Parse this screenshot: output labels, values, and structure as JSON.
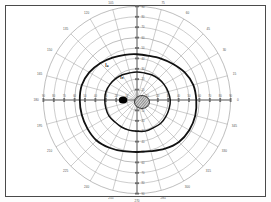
{
  "chart_data": {
    "type": "scatter",
    "projection": "polar",
    "xlabel": "",
    "ylabel": "",
    "grid": true,
    "legend_position": "inline-annotations",
    "center": {
      "x": 137,
      "y": 100,
      "label": "fixation"
    },
    "radial_axis": {
      "label": "eccentricity (degrees)",
      "ticks": [
        10,
        20,
        30,
        40,
        50,
        60,
        70,
        80,
        90
      ],
      "range": [
        0,
        90
      ],
      "ring_spacing_deg": 10,
      "px_per_10deg": 10.4
    },
    "angular_axis": {
      "label": "meridian (degrees)",
      "ticks": [
        0,
        15,
        30,
        45,
        60,
        75,
        90,
        105,
        120,
        135,
        150,
        165,
        180,
        195,
        210,
        225,
        240,
        255,
        270,
        285,
        300,
        315,
        330,
        345
      ],
      "spacing_deg": 15
    },
    "meridian_labels": [
      {
        "angle": 0,
        "text": "0"
      },
      {
        "angle": 15,
        "text": "15"
      },
      {
        "angle": 30,
        "text": "30"
      },
      {
        "angle": 45,
        "text": "45"
      },
      {
        "angle": 60,
        "text": "60"
      },
      {
        "angle": 75,
        "text": "75"
      },
      {
        "angle": 90,
        "text": "90"
      },
      {
        "angle": 105,
        "text": "105"
      },
      {
        "angle": 120,
        "text": "120"
      },
      {
        "angle": 135,
        "text": "135"
      },
      {
        "angle": 150,
        "text": "150"
      },
      {
        "angle": 165,
        "text": "165"
      },
      {
        "angle": 180,
        "text": "180"
      },
      {
        "angle": 195,
        "text": "195"
      },
      {
        "angle": 210,
        "text": "210"
      },
      {
        "angle": 225,
        "text": "225"
      },
      {
        "angle": 240,
        "text": "240"
      },
      {
        "angle": 255,
        "text": "255"
      },
      {
        "angle": 270,
        "text": "270"
      },
      {
        "angle": 285,
        "text": "285"
      },
      {
        "angle": 300,
        "text": "300"
      },
      {
        "angle": 315,
        "text": "315"
      },
      {
        "angle": 330,
        "text": "330"
      },
      {
        "angle": 345,
        "text": "345"
      }
    ],
    "horizontal_tick_labels_left": [
      "90",
      "80",
      "70",
      "60",
      "50",
      "40",
      "30",
      "20",
      "10"
    ],
    "horizontal_tick_labels_right": [
      "10",
      "20",
      "30",
      "40",
      "50",
      "60",
      "70",
      "80",
      "90"
    ],
    "vertical_tick_labels_up": [
      "10",
      "20",
      "30",
      "40",
      "50",
      "60",
      "70",
      "80",
      "90"
    ],
    "vertical_tick_labels_down": [
      "10",
      "20",
      "30",
      "40",
      "50",
      "60",
      "70",
      "80",
      "90"
    ],
    "series": [
      {
        "name": "I4",
        "label": "I₄",
        "type": "isopter",
        "stroke": "#111111",
        "stroke_width": 1.8,
        "label_position": {
          "angle": 131,
          "radius_deg": 44
        },
        "points_deg": [
          {
            "angle": 0,
            "r": 57
          },
          {
            "angle": 15,
            "r": 56
          },
          {
            "angle": 30,
            "r": 53
          },
          {
            "angle": 45,
            "r": 49
          },
          {
            "angle": 60,
            "r": 46
          },
          {
            "angle": 75,
            "r": 44
          },
          {
            "angle": 90,
            "r": 44
          },
          {
            "angle": 105,
            "r": 45
          },
          {
            "angle": 120,
            "r": 47
          },
          {
            "angle": 135,
            "r": 50
          },
          {
            "angle": 150,
            "r": 53
          },
          {
            "angle": 165,
            "r": 55
          },
          {
            "angle": 180,
            "r": 55
          },
          {
            "angle": 195,
            "r": 55
          },
          {
            "angle": 210,
            "r": 55
          },
          {
            "angle": 225,
            "r": 55
          },
          {
            "angle": 240,
            "r": 53
          },
          {
            "angle": 255,
            "r": 51
          },
          {
            "angle": 270,
            "r": 50
          },
          {
            "angle": 285,
            "r": 51
          },
          {
            "angle": 300,
            "r": 54
          },
          {
            "angle": 315,
            "r": 57
          },
          {
            "angle": 330,
            "r": 58
          },
          {
            "angle": 345,
            "r": 58
          }
        ]
      },
      {
        "name": "I3",
        "label": "I₃",
        "type": "isopter",
        "stroke": "#111111",
        "stroke_width": 1.5,
        "label_position": {
          "angle": 124,
          "radius_deg": 26
        },
        "points_deg": [
          {
            "angle": 0,
            "r": 32
          },
          {
            "angle": 15,
            "r": 31
          },
          {
            "angle": 30,
            "r": 30
          },
          {
            "angle": 45,
            "r": 29
          },
          {
            "angle": 60,
            "r": 28
          },
          {
            "angle": 75,
            "r": 27
          },
          {
            "angle": 90,
            "r": 27
          },
          {
            "angle": 105,
            "r": 27
          },
          {
            "angle": 120,
            "r": 28
          },
          {
            "angle": 135,
            "r": 29
          },
          {
            "angle": 150,
            "r": 30
          },
          {
            "angle": 165,
            "r": 31
          },
          {
            "angle": 180,
            "r": 31
          },
          {
            "angle": 195,
            "r": 31
          },
          {
            "angle": 210,
            "r": 31
          },
          {
            "angle": 225,
            "r": 30
          },
          {
            "angle": 240,
            "r": 30
          },
          {
            "angle": 255,
            "r": 30
          },
          {
            "angle": 270,
            "r": 30
          },
          {
            "angle": 285,
            "r": 31
          },
          {
            "angle": 300,
            "r": 31
          },
          {
            "angle": 315,
            "r": 32
          },
          {
            "angle": 330,
            "r": 32
          },
          {
            "angle": 345,
            "r": 32
          }
        ]
      }
    ],
    "markers": [
      {
        "name": "blind-spot",
        "shape": "filled-ellipse",
        "fill": "#000000",
        "center_px": {
          "x": 123,
          "y": 100
        },
        "rx_px": 4.2,
        "ry_px": 3.6
      },
      {
        "name": "central-scotoma",
        "shape": "hatched-blob",
        "fill": "#9a9a9a",
        "stroke": "#111111",
        "center_px": {
          "x": 142,
          "y": 102
        },
        "rx_px": 7.5,
        "ry_px": 6.5
      }
    ],
    "colors": {
      "grid": "#9a9a9a",
      "axis": "#6d6d6d",
      "isopter": "#111111",
      "marker": "#000000",
      "text": "#555555",
      "border": "#4a4a4a",
      "background": "#ffffff"
    }
  },
  "annotations": {
    "outer_isopter_label": "I₄",
    "inner_isopter_label": "I₃"
  }
}
